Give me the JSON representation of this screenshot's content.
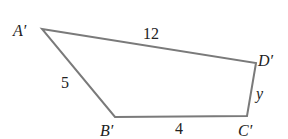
{
  "figure": {
    "type": "quadrilateral",
    "vertices": [
      {
        "name": "A'",
        "x": 42,
        "y": 29
      },
      {
        "name": "D'",
        "x": 256,
        "y": 63
      },
      {
        "name": "C'",
        "x": 247,
        "y": 116
      },
      {
        "name": "B'",
        "x": 115,
        "y": 117
      }
    ],
    "labels": {
      "A": "A′",
      "B": "B′",
      "C": "C′",
      "D": "D′"
    },
    "sides": {
      "AD": "12",
      "AB": "5",
      "BC": "4",
      "CD": "y"
    },
    "stroke_color": "#7a7a7a"
  }
}
